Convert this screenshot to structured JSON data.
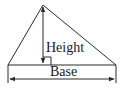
{
  "diagram": {
    "type": "triangle-height-base",
    "labels": {
      "height": "Height",
      "base": "Base"
    },
    "colors": {
      "stroke": "#2a2a2a",
      "text": "#1a1a1a",
      "background": "#ffffff"
    },
    "elements": {
      "triangle": {
        "apex": [
          43,
          5
        ],
        "left": [
          8,
          65
        ],
        "right": [
          116,
          65
        ]
      },
      "height_line": {
        "from": [
          43,
          5
        ],
        "to": [
          43,
          65
        ]
      },
      "right_angle_marker": {
        "x": 43,
        "y": 57,
        "size": 8
      },
      "base_dimension": {
        "y": 79,
        "from_x": 8,
        "to_x": 116
      }
    }
  }
}
